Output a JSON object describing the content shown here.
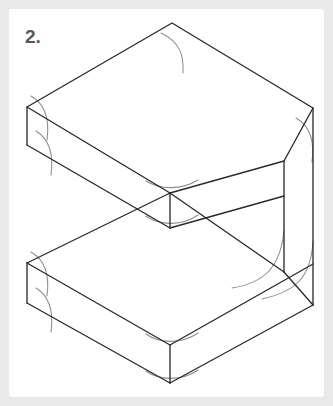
{
  "figure": {
    "step_label": "2.",
    "caption_visible_text": "2.",
    "panel_background": "#fefefe",
    "outer_background": "#e9e9e9",
    "line_color": "#2b2b2b",
    "guide_line_color": "#8c8c8c",
    "description_name": "step-2-isometric-block-line-drawing"
  },
  "geometry": {
    "units": "px",
    "canvas": {
      "width": 333,
      "height": 406
    },
    "top_slab": {
      "name": "upper-slab",
      "top_face": [
        [
          172,
          23
        ],
        [
          313,
          108
        ],
        [
          284,
          161
        ],
        [
          170,
          193
        ],
        [
          27,
          107
        ]
      ],
      "slab_thickness": 36,
      "left_corner": [
        27,
        107
      ],
      "front_corner": [
        170,
        193
      ],
      "right_corner": [
        313,
        108
      ],
      "back_corner": [
        172,
        23
      ]
    },
    "bottom_slab": {
      "name": "lower-slab",
      "top_face_front_corner": [
        170,
        345
      ],
      "left_corner": [
        27,
        263
      ],
      "slab_thickness": 38,
      "inner_corner": [
        284,
        272
      ]
    },
    "back_wall": {
      "name": "vertical-back-wall",
      "outer_right_edge_top": [
        313,
        108
      ],
      "outer_right_edge_bottom": [
        313,
        305
      ],
      "inner_edge_top": [
        284,
        161
      ],
      "inner_edge_bottom": [
        284,
        272
      ]
    },
    "guides": {
      "count": 9,
      "purpose": "rounded-corner-construction-arcs"
    }
  }
}
